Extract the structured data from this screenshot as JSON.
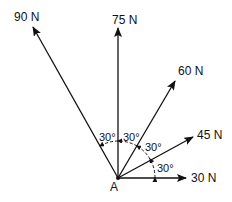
{
  "origin": {
    "label": "A"
  },
  "forces": [
    {
      "label": "30 N",
      "angle_deg": 0
    },
    {
      "label": "45 N",
      "angle_deg": 30
    },
    {
      "label": "60 N",
      "angle_deg": 60
    },
    {
      "label": "75 N",
      "angle_deg": 90
    },
    {
      "label": "90 N",
      "angle_deg": 120
    }
  ],
  "angles": [
    "30°",
    "30°",
    "30°",
    "30°"
  ]
}
